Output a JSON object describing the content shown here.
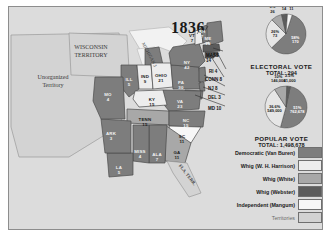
{
  "map": {
    "title": "1836",
    "territory_labels": [
      {
        "name": "unorganized-territory",
        "text": "Unorganized\nTerritory",
        "x": 22,
        "y": 72
      },
      {
        "name": "wisconsin-territory",
        "text": "WISCONSIN\nTERRITORY",
        "x": 66,
        "y": 44
      },
      {
        "name": "michigan-label",
        "text": "MICHIGAN 3",
        "x": 140,
        "y": 50
      },
      {
        "name": "florida-territory",
        "text": "FLA. TERR.",
        "x": 176,
        "y": 168
      }
    ],
    "states": [
      {
        "name": "maine",
        "abbr": "ME",
        "votes": "10",
        "party": "democratic",
        "x": 199,
        "y": 29
      },
      {
        "name": "vermont",
        "abbr": "VT",
        "votes": "7",
        "party": "whig-harrison",
        "x": 183,
        "y": 26
      },
      {
        "name": "new-hampshire",
        "abbr": "NH",
        "votes": "7",
        "party": "democratic",
        "x": 193,
        "y": 22
      },
      {
        "name": "new-york",
        "abbr": "NY",
        "votes": "42",
        "party": "democratic",
        "x": 178,
        "y": 53
      },
      {
        "name": "pennsylvania",
        "abbr": "PA",
        "votes": "30",
        "party": "democratic",
        "x": 172,
        "y": 73
      },
      {
        "name": "ohio",
        "abbr": "OHIO",
        "votes": "21",
        "party": "whig-harrison",
        "x": 152,
        "y": 66
      },
      {
        "name": "indiana",
        "abbr": "IND",
        "votes": "9",
        "party": "whig-harrison",
        "x": 136,
        "y": 67
      },
      {
        "name": "illinois",
        "abbr": "ILL",
        "votes": "5",
        "party": "democratic",
        "x": 120,
        "y": 70
      },
      {
        "name": "missouri",
        "abbr": "MO",
        "votes": "4",
        "party": "democratic",
        "x": 99,
        "y": 85
      },
      {
        "name": "arkansas",
        "abbr": "ARK",
        "votes": "3",
        "party": "democratic",
        "x": 102,
        "y": 124
      },
      {
        "name": "louisiana",
        "abbr": "LA",
        "votes": "5",
        "party": "democratic",
        "x": 110,
        "y": 158
      },
      {
        "name": "mississippi",
        "abbr": "MISS",
        "votes": "4",
        "party": "democratic",
        "x": 131,
        "y": 142
      },
      {
        "name": "alabama",
        "abbr": "ALA",
        "votes": "7",
        "party": "democratic",
        "x": 148,
        "y": 145
      },
      {
        "name": "georgia",
        "abbr": "GA",
        "votes": "11",
        "party": "whig-white",
        "x": 168,
        "y": 143
      },
      {
        "name": "tennessee",
        "abbr": "TENN",
        "votes": "15",
        "party": "whig-white",
        "x": 136,
        "y": 110
      },
      {
        "name": "kentucky",
        "abbr": "KY",
        "votes": "15",
        "party": "whig-harrison",
        "x": 143,
        "y": 90
      },
      {
        "name": "virginia",
        "abbr": "VA",
        "votes": "23",
        "party": "democratic",
        "x": 171,
        "y": 92
      },
      {
        "name": "north-carolina",
        "abbr": "NC",
        "votes": "15",
        "party": "democratic",
        "x": 177,
        "y": 111
      },
      {
        "name": "south-carolina",
        "abbr": "SC",
        "votes": "11",
        "party": "independent",
        "x": 173,
        "y": 127
      }
    ],
    "leader_labels": [
      {
        "name": "massachusetts-leader",
        "text": "MASS",
        "sub": "14",
        "x": 197,
        "y": 46
      },
      {
        "name": "rhode-island-leader",
        "text": "RI 4",
        "x": 200,
        "y": 62
      },
      {
        "name": "connecticut-leader",
        "text": "CONN 8",
        "x": 196,
        "y": 70
      },
      {
        "name": "new-jersey-leader",
        "text": "NJ 8",
        "x": 199,
        "y": 79
      },
      {
        "name": "delaware-leader",
        "text": "DEL 3",
        "x": 199,
        "y": 88
      },
      {
        "name": "maryland-leader",
        "text": "MD 10",
        "x": 199,
        "y": 99
      }
    ]
  },
  "panel": {
    "electoral": {
      "title": "ELECTORAL  VOTE",
      "total_label": "TOTAL:  294",
      "slices": [
        {
          "name": "democratic",
          "pct": "58%",
          "value": "170",
          "share": 57.8,
          "color": "#7d7d7d",
          "label_class": "inw"
        },
        {
          "name": "whig-harrison",
          "pct": "26%",
          "value": "73",
          "share": 24.8,
          "color": "#e6e6e6",
          "label_class": "ind"
        },
        {
          "name": "whig-white",
          "pct": "9%",
          "value": "26",
          "share": 8.8,
          "color": "#a8a8a8",
          "label_class": "out"
        },
        {
          "name": "whig-webster",
          "pct": "4.8%",
          "value": "14",
          "share": 4.8,
          "color": "#5c5c5c",
          "label_class": "out"
        },
        {
          "name": "independent-mangum",
          "pct": "3.8%",
          "value": "11",
          "share": 3.8,
          "color": "#f4f4f4",
          "label_class": "out"
        }
      ]
    },
    "popular": {
      "title": "POPULAR  VOTE",
      "total_label": "TOTAL:  1,498,678",
      "slices": [
        {
          "name": "democratic",
          "pct": "51%",
          "value": "762,678",
          "share": 50.9,
          "color": "#7d7d7d",
          "label_class": "inw"
        },
        {
          "name": "whig-harrison",
          "pct": "36.6%",
          "value": "549,000",
          "share": 36.6,
          "color": "#e6e6e6",
          "label_class": "ind"
        },
        {
          "name": "whig-white",
          "pct": "10%",
          "value": "146,000",
          "share": 9.8,
          "color": "#a8a8a8",
          "label_class": "out"
        },
        {
          "name": "whig-webster",
          "pct": "2.5%",
          "value": "41,000",
          "share": 2.7,
          "color": "#5c5c5c",
          "label_class": "out"
        }
      ]
    },
    "legend": [
      {
        "name": "democratic",
        "label": "Democratic (Van Buren)",
        "color": "#7d7d7d",
        "muted": false
      },
      {
        "name": "whig-harrison",
        "label": "Whig (W. H. Harrison)",
        "color": "#ededed",
        "muted": false
      },
      {
        "name": "whig-white",
        "label": "Whig (White)",
        "color": "#a8a8a8",
        "muted": false
      },
      {
        "name": "whig-webster",
        "label": "Whig (Webster)",
        "color": "#5c5c5c",
        "muted": false
      },
      {
        "name": "independent-mangum",
        "label": "Independent (Mangum)",
        "color": "#f7f7f7",
        "muted": false
      },
      {
        "name": "territories",
        "label": "Territories",
        "color": "#d2d2d2",
        "muted": true
      }
    ]
  },
  "chart_data": [
    {
      "type": "pie",
      "title": "ELECTORAL VOTE",
      "subtitle": "TOTAL: 294",
      "categories": [
        "Democratic (Van Buren)",
        "Whig (W. H. Harrison)",
        "Whig (White)",
        "Whig (Webster)",
        "Independent (Mangum)"
      ],
      "values": [
        170,
        73,
        26,
        14,
        11
      ],
      "percents": [
        58,
        26,
        9,
        4.8,
        3.8
      ],
      "legend": "right"
    },
    {
      "type": "pie",
      "title": "POPULAR VOTE",
      "subtitle": "TOTAL: 1,498,678",
      "categories": [
        "Democratic (Van Buren)",
        "Whig (W. H. Harrison)",
        "Whig (White)",
        "Whig (Webster)"
      ],
      "values": [
        762678,
        549000,
        146000,
        41000
      ],
      "percents": [
        51,
        36.6,
        10,
        2.5
      ],
      "legend": "right"
    }
  ]
}
